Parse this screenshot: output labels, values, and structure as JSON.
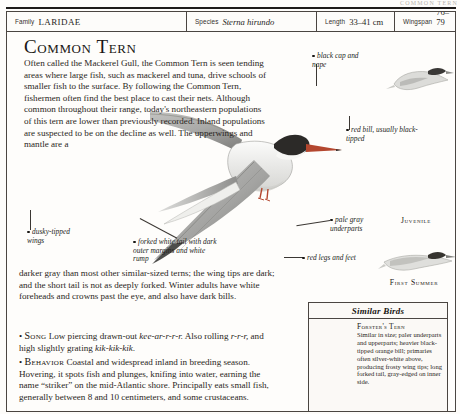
{
  "running_head": "COMMON TERN",
  "spec_table": {
    "rows": [
      {
        "label": "Family",
        "value": "LARIDAE",
        "style": "smallcaps"
      },
      {
        "label": "Species",
        "value": "Sterna hirundo",
        "style": "italic"
      },
      {
        "label": "Length",
        "value": "33–41 cm",
        "style": "plain"
      },
      {
        "label": "Wingspan",
        "value": "76–79 cm",
        "style": "plain"
      }
    ]
  },
  "title": "Common Tern",
  "body": {
    "intro": "Often called the Mackerel Gull, the Common Tern is seen tending areas where large fish, such as mackerel and tuna, drive schools of smaller fish to the surface. By following the Common Tern, fishermen often find the best place to cast their nets. Although common throughout their range, today's northeastern populations of this tern are lower than previously recorded. Inland populations are suspected to be on the decline as well. The upperwings and mantle are a",
    "continuation": "darker gray than most other similar-sized terns; the wing tips are dark; and the short tail is not as deeply forked. Winter adults have white foreheads and crowns past the eye, and also have dark bills.",
    "song_label": "Song",
    "song_text_a": "Low piercing drawn-out ",
    "song_call_a": "kee-ar-r-r-r.",
    "song_text_b": " Also rolling ",
    "song_call_b": "r-r-r,",
    "song_text_c": " and high slightly grating ",
    "song_call_c": "kik-kik-kik.",
    "behavior_label": "Behavior",
    "behavior_text": "Coastal and widespread inland in breeding season. Hovering, it spots fish and plunges, knifing into water, earning the name “striker” on the mid-Atlantic shore. Principally eats small fish, generally between 8 and 10 centimeters, and some crustaceans."
  },
  "annotations": [
    {
      "id": "black-cap",
      "text": "black cap and nape"
    },
    {
      "id": "red-bill",
      "text": "red bill, usually black-tipped"
    },
    {
      "id": "pale-gray",
      "text": "pale gray underparts"
    },
    {
      "id": "red-legs",
      "text": "red legs and feet"
    },
    {
      "id": "dusky-wings",
      "text": "dusky-tipped wings"
    },
    {
      "id": "forked-tail",
      "text": "forked white tail with dark outer margins and white rump"
    }
  ],
  "stage_labels": [
    {
      "id": "juvenile",
      "text": "Juvenile"
    },
    {
      "id": "first-summer",
      "text": "First Summer"
    }
  ],
  "similar_birds": {
    "heading": "Similar Birds",
    "entry_name": "Forster's Tern",
    "entry_text": "Similar in size; paler underparts and upperparts; heavier black-tipped orange bill; primaries often silver-white above, producing frosty wing tips; long forked tail, gray-edged on inner side."
  },
  "colors": {
    "ink": "#1a1714",
    "rule": "#4a4541",
    "paper": "#fdfcfa",
    "bill_red": "#b4472f",
    "cap_black": "#2c2a28",
    "wing_gray": "#9a9a98"
  }
}
